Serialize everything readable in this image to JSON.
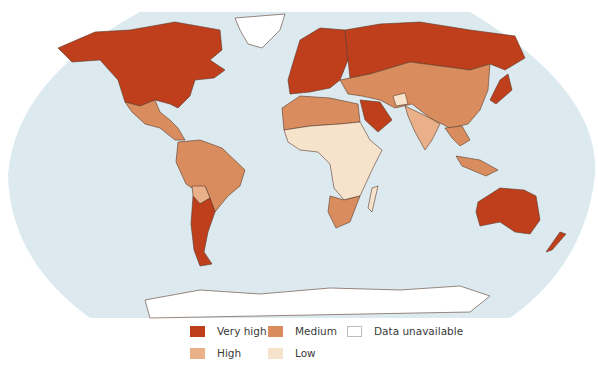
{
  "map": {
    "projection": "Robinson-like world map",
    "ocean_color": "#dceaf0",
    "border_color": "#5a3a2a",
    "categories": {
      "very_high": "#bf3e1c",
      "high": "#eab08a",
      "medium": "#d98d5e",
      "low": "#f7e3cc",
      "data_unavailable": "#ffffff"
    },
    "regions": [
      {
        "name": "North America (USA, Canada)",
        "category": "very_high"
      },
      {
        "name": "Greenland",
        "category": "data_unavailable"
      },
      {
        "name": "Mexico & Central America",
        "category": "medium"
      },
      {
        "name": "South America (north)",
        "category": "medium"
      },
      {
        "name": "Bolivia",
        "category": "high"
      },
      {
        "name": "Argentina & Chile",
        "category": "very_high"
      },
      {
        "name": "Europe",
        "category": "very_high"
      },
      {
        "name": "Russia",
        "category": "very_high"
      },
      {
        "name": "Japan & Korea",
        "category": "very_high"
      },
      {
        "name": "Saudi Arabia",
        "category": "very_high"
      },
      {
        "name": "Central Asia, China, Middle East",
        "category": "medium"
      },
      {
        "name": "South Asia",
        "category": "high"
      },
      {
        "name": "Afghanistan",
        "category": "low"
      },
      {
        "name": "North Africa",
        "category": "medium"
      },
      {
        "name": "Sub-Saharan Africa",
        "category": "low"
      },
      {
        "name": "Southern Africa",
        "category": "medium"
      },
      {
        "name": "Southeast Asia",
        "category": "medium"
      },
      {
        "name": "Australia & New Zealand",
        "category": "very_high"
      },
      {
        "name": "Antarctica",
        "category": "data_unavailable"
      }
    ]
  },
  "legend": {
    "items": [
      {
        "label": "Very high",
        "color": "#bf3e1c"
      },
      {
        "label": "Medium",
        "color": "#d98d5e"
      },
      {
        "label": "Data unavailable",
        "color": "#ffffff"
      },
      {
        "label": "High",
        "color": "#eab08a"
      },
      {
        "label": "Low",
        "color": "#f7e3cc"
      }
    ]
  }
}
